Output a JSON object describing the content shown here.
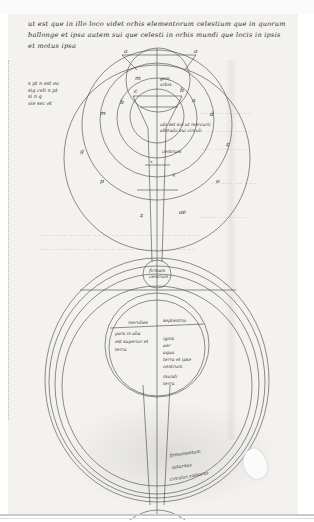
{
  "document": {
    "type": "medieval manuscript folio (scan)",
    "text_lines": [
      "ut est que in illo loco videt orbis elementorum celestium que in quorum",
      "ballonge et ipsa autem sui que celesti in orbis mundi que locis in ipsis",
      "et motus ipsa"
    ],
    "margin_note": "s pt n est eo\nsig celi n pt\nsi n q\nvie sec et"
  },
  "upper_diagram": {
    "labels": {
      "top_left": "a",
      "top_right": "a",
      "m": "m",
      "c": "c",
      "b_right": "b",
      "b_left": "b",
      "a_right": "a",
      "m_left": "m",
      "d_right": "d",
      "center_note_1": "gem",
      "center_note_2": "orbis",
      "lower_note_1": "ubi est sol ut mercurii",
      "lower_note_2": "altitudo sui circuli",
      "inner_note": "centrum",
      "g": "g",
      "z_right": "z",
      "p": "p",
      "o": "o",
      "q": "q",
      "x": "x",
      "z": "z",
      "ae": "ae"
    }
  },
  "lower_diagram": {
    "top_circle_label_1": "firmam",
    "top_circle_label_2": "centrum",
    "hemisphere_left": "meridies",
    "hemisphere_right": "septentrio",
    "left_notes": [
      "pars in alia",
      "est superior et",
      "terra"
    ],
    "right_notes": [
      "ignis",
      "aer",
      "aqua",
      "terra et ipse",
      "centrum",
      "mundi",
      "terra"
    ],
    "ring_labels": [
      "firmamentum",
      "saturnus",
      "circulus zodiacus"
    ]
  }
}
